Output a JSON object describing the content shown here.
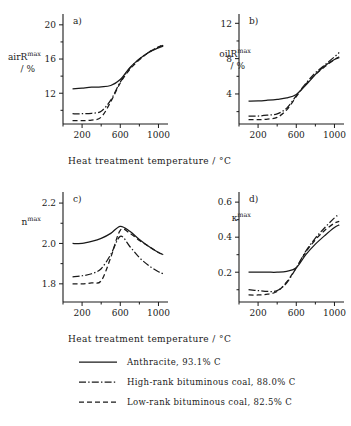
{
  "figure": {
    "xtitle_a": "Heat treatment temperature / °C",
    "xtitle_b": "Heat treatment temperature / °C"
  },
  "legend": {
    "items": [
      {
        "style": "solid",
        "label": "Anthracite, 93.1% C"
      },
      {
        "style": "dashdot",
        "label": "High-rank bituminous coal, 88.0% C"
      },
      {
        "style": "dashed",
        "label": "Low-rank bituminous coal, 82.5% C"
      }
    ]
  },
  "chart_data": [
    {
      "type": "line",
      "panel": "a)",
      "title": "",
      "ylabel_main": "air",
      "ylabel_sym": "R",
      "ylabel_sup": "max",
      "ylabel_unit": "/ %",
      "xlabel": "Heat treatment temperature / °C",
      "ylabel": "air R max / %",
      "xlim": [
        0,
        1100
      ],
      "ylim": [
        8.4,
        20.8
      ],
      "xticks": [
        200,
        600,
        1000
      ],
      "yticks": [
        12,
        16,
        20
      ],
      "xticklabels": [
        "200",
        "600",
        "1000"
      ],
      "yticklabels": [
        "12",
        "16",
        "20"
      ],
      "grid": false,
      "legend_position": "below-figure",
      "x": [
        100,
        200,
        300,
        400,
        500,
        600,
        700,
        800,
        900,
        1000,
        1050
      ],
      "series": [
        {
          "name": "Anthracite, 93.1% C",
          "style": "solid",
          "values": [
            12.5,
            12.6,
            12.7,
            12.75,
            12.9,
            13.6,
            15.0,
            16.0,
            16.8,
            17.3,
            17.5
          ]
        },
        {
          "name": "High-rank bituminous coal, 88.0% C",
          "style": "dashdot",
          "values": [
            9.6,
            9.6,
            9.65,
            9.9,
            11.2,
            13.3,
            14.9,
            16.0,
            16.8,
            17.4,
            17.6
          ]
        },
        {
          "name": "Low-rank bituminous coal, 82.5% C",
          "style": "dashed",
          "values": [
            8.8,
            8.8,
            8.85,
            9.2,
            11.0,
            13.2,
            14.8,
            15.9,
            16.8,
            17.4,
            17.7
          ]
        }
      ]
    },
    {
      "type": "line",
      "panel": "b)",
      "title": "",
      "ylabel_main": "oil",
      "ylabel_sym": "R",
      "ylabel_sup": "max",
      "ylabel_unit": "/ %",
      "xlabel": "Heat treatment temperature / °C",
      "ylabel": "oil R max / %",
      "xlim": [
        0,
        1100
      ],
      "ylim": [
        0.6,
        12.6
      ],
      "xticks": [
        200,
        600,
        1000
      ],
      "yticks": [
        4,
        8,
        12
      ],
      "xticklabels": [
        "200",
        "600",
        "1000"
      ],
      "yticklabels": [
        "4",
        "8",
        "12"
      ],
      "grid": false,
      "legend_position": "below-figure",
      "x": [
        100,
        200,
        300,
        400,
        500,
        600,
        700,
        800,
        900,
        1000,
        1050
      ],
      "series": [
        {
          "name": "Anthracite, 93.1% C",
          "style": "solid",
          "values": [
            3.2,
            3.22,
            3.3,
            3.4,
            3.55,
            3.95,
            5.0,
            6.2,
            7.2,
            7.9,
            8.1
          ]
        },
        {
          "name": "High-rank bituminous coal, 88.0% C",
          "style": "dashdot",
          "values": [
            1.5,
            1.5,
            1.6,
            1.75,
            2.4,
            3.8,
            5.2,
            6.4,
            7.3,
            8.2,
            8.7
          ]
        },
        {
          "name": "Low-rank bituminous coal, 82.5% C",
          "style": "dashed",
          "values": [
            1.1,
            1.1,
            1.15,
            1.35,
            2.2,
            3.7,
            5.1,
            6.2,
            7.1,
            7.9,
            8.2
          ]
        }
      ]
    },
    {
      "type": "line",
      "panel": "c)",
      "title": "",
      "ylabel_main": "",
      "ylabel_sym": "n",
      "ylabel_sup": "max",
      "ylabel_unit": "",
      "xlabel": "Heat treatment temperature / °C",
      "ylabel": "n max",
      "xlim": [
        0,
        1100
      ],
      "ylim": [
        1.71,
        2.235
      ],
      "xticks": [
        200,
        600,
        1000
      ],
      "yticks": [
        1.8,
        2.0,
        2.2
      ],
      "xticklabels": [
        "200",
        "600",
        "1000"
      ],
      "yticklabels": [
        "1.8",
        "2.0",
        "2.2"
      ],
      "grid": false,
      "legend_position": "below-figure",
      "x": [
        100,
        200,
        300,
        400,
        500,
        600,
        700,
        800,
        900,
        1000,
        1050
      ],
      "series": [
        {
          "name": "Anthracite, 93.1% C",
          "style": "solid",
          "values": [
            2.0,
            2.0,
            2.01,
            2.025,
            2.05,
            2.085,
            2.06,
            2.02,
            1.985,
            1.955,
            1.945
          ]
        },
        {
          "name": "High-rank bituminous coal, 88.0% C",
          "style": "dashdot",
          "values": [
            1.835,
            1.84,
            1.85,
            1.875,
            1.945,
            2.035,
            1.985,
            1.93,
            1.89,
            1.86,
            1.85
          ]
        },
        {
          "name": "Low-rank bituminous coal, 82.5% C",
          "style": "dashed",
          "values": [
            1.8,
            1.8,
            1.805,
            1.815,
            1.93,
            2.065,
            2.05,
            2.015,
            1.985,
            1.955,
            1.945
          ]
        }
      ]
    },
    {
      "type": "line",
      "panel": "d)",
      "title": "",
      "ylabel_main": "",
      "ylabel_sym": "κ",
      "ylabel_sup": "max",
      "ylabel_unit": "",
      "xlabel": "Heat treatment temperature / °C",
      "ylabel": "κ max",
      "xlim": [
        0,
        1100
      ],
      "ylim": [
        0.03,
        0.635
      ],
      "xticks": [
        200,
        600,
        1000
      ],
      "yticks": [
        0.2,
        0.4,
        0.6
      ],
      "xticklabels": [
        "0.2",
        "0.4",
        "0.6"
      ],
      "yticklabels": [
        "0.2",
        "0.4",
        "0.6"
      ],
      "grid": false,
      "legend_position": "below-figure",
      "x": [
        100,
        200,
        300,
        400,
        500,
        600,
        700,
        800,
        900,
        1000,
        1050
      ],
      "series": [
        {
          "name": "Anthracite, 93.1% C",
          "style": "solid",
          "values": [
            0.2,
            0.2,
            0.2,
            0.2,
            0.205,
            0.225,
            0.3,
            0.36,
            0.41,
            0.455,
            0.47
          ]
        },
        {
          "name": "High-rank bituminous coal, 88.0% C",
          "style": "dashdot",
          "values": [
            0.1,
            0.095,
            0.09,
            0.095,
            0.14,
            0.225,
            0.32,
            0.395,
            0.455,
            0.51,
            0.53
          ]
        },
        {
          "name": "Low-rank bituminous coal, 82.5% C",
          "style": "dashed",
          "values": [
            0.07,
            0.07,
            0.075,
            0.09,
            0.145,
            0.225,
            0.315,
            0.385,
            0.44,
            0.48,
            0.49
          ]
        }
      ]
    }
  ]
}
